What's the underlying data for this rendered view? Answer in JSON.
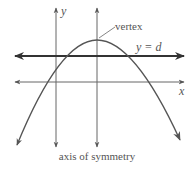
{
  "diagram": {
    "labels": {
      "y_axis": "y",
      "x_axis": "x",
      "vertex": "vertex",
      "line": "y = d",
      "axis_of_symmetry": "axis of symmetry"
    },
    "colors": {
      "curve": "#555555",
      "axes": "#666666",
      "line_d": "#333333",
      "text": "#555555",
      "background": "#ffffff"
    },
    "elements": [
      {
        "type": "axis",
        "name": "y-axis",
        "direction": "vertical",
        "arrows": "both"
      },
      {
        "type": "axis",
        "name": "x-axis",
        "direction": "horizontal",
        "arrows": "both"
      },
      {
        "type": "line",
        "name": "axis of symmetry",
        "direction": "vertical",
        "through": "vertex",
        "arrows": "both"
      },
      {
        "type": "line",
        "name": "y = d",
        "direction": "horizontal",
        "position": "below vertex, above x-axis",
        "arrows": "both",
        "weight": "bold"
      },
      {
        "type": "curve",
        "name": "parabola",
        "opens": "down",
        "arrows": "both ends"
      },
      {
        "type": "callout",
        "name": "vertex",
        "target": "maximum point of parabola"
      }
    ]
  }
}
